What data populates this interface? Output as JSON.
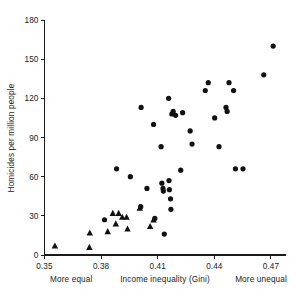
{
  "chart_data": {
    "type": "scatter",
    "title": "",
    "xlabel": "Income inequality (Gini)",
    "ylabel": "Homicides per million people",
    "xlim": [
      0.35,
      0.478
    ],
    "ylim": [
      0,
      180
    ],
    "xticks": [
      0.35,
      0.38,
      0.41,
      0.44,
      0.47
    ],
    "xtick_labels": [
      "0.35",
      "0.38",
      "0.41",
      "0.44",
      "0.47"
    ],
    "yticks": [
      0,
      30,
      60,
      90,
      120,
      150,
      180
    ],
    "ytick_labels": [
      "0",
      "30",
      "60",
      "90",
      "120",
      "150",
      "180"
    ],
    "grid": false,
    "legend": false,
    "annotations": [
      {
        "name": "more-equal",
        "text": "More equal",
        "x": 0.358,
        "position": "below-axis-left"
      },
      {
        "name": "axis-caption",
        "text": "Income inequality (Gini)",
        "x": 0.412,
        "position": "below-axis-center"
      },
      {
        "name": "more-unequal",
        "text": "More unequal",
        "x": 0.466,
        "position": "below-axis-right"
      }
    ],
    "series": [
      {
        "name": "more-equal-group",
        "marker": "triangle",
        "color": "#111111",
        "points": [
          {
            "x": 0.3555,
            "y": 7
          },
          {
            "x": 0.374,
            "y": 17
          },
          {
            "x": 0.3738,
            "y": 6
          },
          {
            "x": 0.3835,
            "y": 18
          },
          {
            "x": 0.3862,
            "y": 32
          },
          {
            "x": 0.3878,
            "y": 24
          },
          {
            "x": 0.3893,
            "y": 32
          },
          {
            "x": 0.3912,
            "y": 29
          },
          {
            "x": 0.3935,
            "y": 29
          },
          {
            "x": 0.394,
            "y": 20
          },
          {
            "x": 0.406,
            "y": 22
          },
          {
            "x": 0.4078,
            "y": 27
          },
          {
            "x": 0.4005,
            "y": 36
          }
        ]
      },
      {
        "name": "less-equal-group",
        "marker": "circle",
        "color": "#111111",
        "points": [
          {
            "x": 0.3818,
            "y": 27
          },
          {
            "x": 0.3882,
            "y": 66
          },
          {
            "x": 0.3955,
            "y": 60
          },
          {
            "x": 0.4012,
            "y": 113
          },
          {
            "x": 0.401,
            "y": 37
          },
          {
            "x": 0.4043,
            "y": 51
          },
          {
            "x": 0.4078,
            "y": 100
          },
          {
            "x": 0.4085,
            "y": 28
          },
          {
            "x": 0.4118,
            "y": 83
          },
          {
            "x": 0.4122,
            "y": 55
          },
          {
            "x": 0.4128,
            "y": 51
          },
          {
            "x": 0.413,
            "y": 49
          },
          {
            "x": 0.4135,
            "y": 16
          },
          {
            "x": 0.4158,
            "y": 120
          },
          {
            "x": 0.416,
            "y": 57
          },
          {
            "x": 0.4162,
            "y": 50
          },
          {
            "x": 0.4168,
            "y": 43
          },
          {
            "x": 0.417,
            "y": 35
          },
          {
            "x": 0.4175,
            "y": 108
          },
          {
            "x": 0.4182,
            "y": 110
          },
          {
            "x": 0.4195,
            "y": 107
          },
          {
            "x": 0.4222,
            "y": 65
          },
          {
            "x": 0.4232,
            "y": 109
          },
          {
            "x": 0.4272,
            "y": 95
          },
          {
            "x": 0.4282,
            "y": 85
          },
          {
            "x": 0.4352,
            "y": 126
          },
          {
            "x": 0.4368,
            "y": 132
          },
          {
            "x": 0.4402,
            "y": 105
          },
          {
            "x": 0.4425,
            "y": 83
          },
          {
            "x": 0.4462,
            "y": 113
          },
          {
            "x": 0.4468,
            "y": 110
          },
          {
            "x": 0.4478,
            "y": 132
          },
          {
            "x": 0.4502,
            "y": 126
          },
          {
            "x": 0.4512,
            "y": 66
          },
          {
            "x": 0.4552,
            "y": 66
          },
          {
            "x": 0.4662,
            "y": 138
          },
          {
            "x": 0.4712,
            "y": 160
          }
        ]
      }
    ]
  }
}
